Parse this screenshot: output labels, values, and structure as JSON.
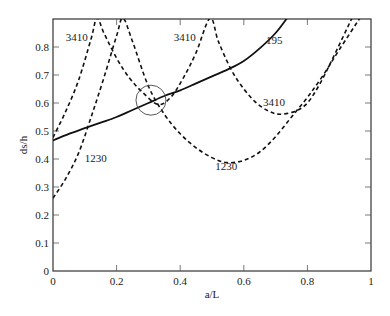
{
  "chart_data": {
    "type": "line",
    "title": "",
    "xlabel": "a/L",
    "ylabel": "ds/h",
    "xlim": [
      0,
      1
    ],
    "ylim": [
      0,
      0.9
    ],
    "x_ticks": [
      0,
      0.2,
      0.4,
      0.6,
      0.8,
      1
    ],
    "x_tick_labels": [
      "0",
      "0.2",
      "0.4",
      "0.6",
      "0.8",
      "1"
    ],
    "y_ticks": [
      0,
      0.1,
      0.2,
      0.3,
      0.4,
      0.5,
      0.6,
      0.7,
      0.8
    ],
    "y_tick_labels": [
      "0",
      "0.1",
      "0.2",
      "0.3",
      "0.4",
      "0.5",
      "0.6",
      "0.7",
      "0.8"
    ],
    "grid": false,
    "legend": "none (inline curve labels)",
    "series": [
      {
        "name": "195",
        "style": "solid",
        "x": [
          0,
          0.05,
          0.1,
          0.15,
          0.2,
          0.25,
          0.3,
          0.35,
          0.4,
          0.45,
          0.5,
          0.55,
          0.6,
          0.65,
          0.7,
          0.736
        ],
        "y": [
          0.466,
          0.49,
          0.51,
          0.53,
          0.55,
          0.575,
          0.6,
          0.625,
          0.645,
          0.67,
          0.695,
          0.72,
          0.75,
          0.795,
          0.85,
          0.903
        ]
      },
      {
        "name": "3410",
        "style": "dashed",
        "x": [
          0,
          0.04,
          0.08,
          0.12,
          0.138,
          0.16,
          0.2,
          0.24,
          0.28,
          0.33,
          0.37,
          0.41,
          0.45,
          0.494,
          0.52,
          0.56,
          0.6,
          0.64,
          0.68,
          0.714,
          0.76,
          0.8,
          0.84,
          0.88,
          0.94
        ],
        "y": [
          0.477,
          0.57,
          0.68,
          0.83,
          0.903,
          0.85,
          0.76,
          0.69,
          0.64,
          0.595,
          0.62,
          0.69,
          0.78,
          0.903,
          0.82,
          0.72,
          0.65,
          0.6,
          0.57,
          0.56,
          0.57,
          0.6,
          0.67,
          0.76,
          0.903
        ]
      },
      {
        "name": "1230",
        "style": "dashed",
        "x": [
          0,
          0.04,
          0.08,
          0.12,
          0.16,
          0.2,
          0.22,
          0.25,
          0.3,
          0.35,
          0.4,
          0.45,
          0.5,
          0.547,
          0.6,
          0.65,
          0.7,
          0.75,
          0.8,
          0.85,
          0.9,
          0.965
        ],
        "y": [
          0.26,
          0.33,
          0.42,
          0.55,
          0.69,
          0.84,
          0.903,
          0.82,
          0.66,
          0.56,
          0.49,
          0.44,
          0.405,
          0.387,
          0.395,
          0.425,
          0.48,
          0.55,
          0.62,
          0.7,
          0.79,
          0.903
        ]
      }
    ],
    "annotations": [
      {
        "type": "text",
        "text": "3410",
        "x": 0.04,
        "y": 0.82
      },
      {
        "type": "text",
        "text": "3410",
        "x": 0.38,
        "y": 0.82
      },
      {
        "type": "text",
        "text": "195",
        "x": 0.67,
        "y": 0.81
      },
      {
        "type": "text",
        "text": "3410",
        "x": 0.66,
        "y": 0.59
      },
      {
        "type": "text",
        "text": "1230",
        "x": 0.51,
        "y": 0.36
      },
      {
        "type": "text",
        "text": "1230",
        "x": 0.1,
        "y": 0.39
      },
      {
        "type": "circle",
        "cx": 0.308,
        "cy": 0.61,
        "r_px": 15
      }
    ]
  }
}
